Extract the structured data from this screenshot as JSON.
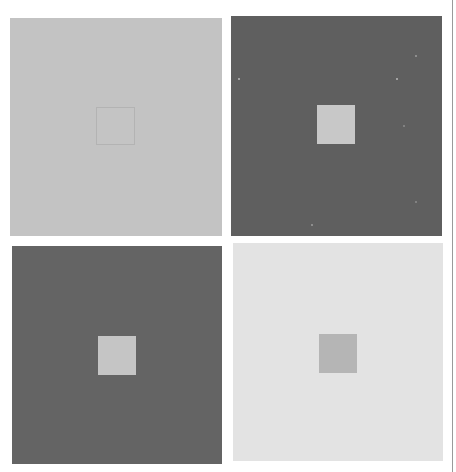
{
  "figure": {
    "panels": [
      {
        "id": "p1",
        "position": "top-left",
        "surround_color": "#c3c3c3",
        "center_color": "#c4c4c4",
        "outer": {
          "x": 10,
          "y": 18,
          "w": 212,
          "h": 218
        },
        "inner": {
          "x": 96,
          "y": 107,
          "w": 39,
          "h": 38
        }
      },
      {
        "id": "p2",
        "position": "top-right",
        "surround_color": "#5f5f5f",
        "center_color": "#c8c8c8",
        "outer": {
          "x": 231,
          "y": 16,
          "w": 211,
          "h": 220
        },
        "inner": {
          "x": 317,
          "y": 105,
          "w": 38,
          "h": 39
        }
      },
      {
        "id": "p3",
        "position": "bottom-left",
        "surround_color": "#646464",
        "center_color": "#c5c5c5",
        "outer": {
          "x": 12,
          "y": 246,
          "w": 210,
          "h": 218
        },
        "inner": {
          "x": 98,
          "y": 336,
          "w": 38,
          "h": 39
        }
      },
      {
        "id": "p4",
        "position": "bottom-right",
        "surround_color": "#e3e3e3",
        "center_color": "#b5b5b5",
        "outer": {
          "x": 233,
          "y": 243,
          "w": 210,
          "h": 218
        },
        "inner": {
          "x": 319,
          "y": 334,
          "w": 38,
          "h": 39
        }
      }
    ]
  }
}
